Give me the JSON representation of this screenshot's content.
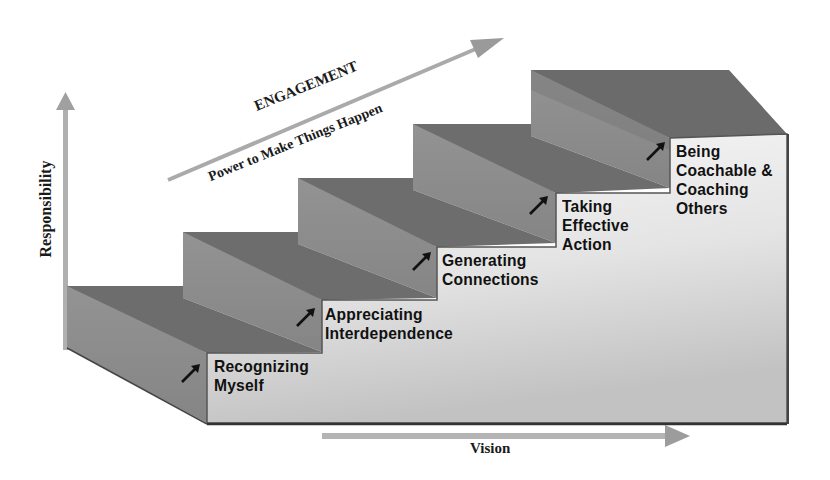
{
  "diagram": {
    "type": "staircase",
    "engagement_arrow": {
      "title": "ENGAGEMENT",
      "subtitle": "Power to Make Things Happen"
    },
    "axes": {
      "vertical_label": "Responsibility",
      "horizontal_label": "Vision"
    },
    "steps": [
      {
        "index": 1,
        "lines": [
          "Recognizing",
          "Myself"
        ]
      },
      {
        "index": 2,
        "lines": [
          "Appreciating",
          "Interdependence"
        ]
      },
      {
        "index": 3,
        "lines": [
          "Generating",
          "Connections"
        ]
      },
      {
        "index": 4,
        "lines": [
          "Taking",
          "Effective",
          "Action"
        ]
      },
      {
        "index": 5,
        "lines": [
          "Being",
          "Coachable &",
          "Coaching",
          "Others"
        ]
      }
    ],
    "step_icon": "arrow-up-right-icon",
    "colors": {
      "tread_dark": "#6f6f6f",
      "riser_mid": "#8c8c8c",
      "front_light": "#eeeeee",
      "front_gradient_end": "#c4c4c4",
      "axis_arrow": "#a8a8a8",
      "text": "#111111"
    }
  }
}
